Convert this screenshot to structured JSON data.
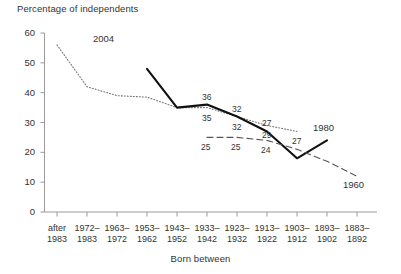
{
  "chart_data": {
    "type": "line",
    "title": "",
    "ylabel": "Percentage of independents",
    "xlabel": "Born between",
    "ylim": [
      0,
      60
    ],
    "yticks": [
      0,
      10,
      20,
      30,
      40,
      50,
      60
    ],
    "grid": false,
    "legend_position": "inline-annotation",
    "categories": [
      "after 1983",
      "1972-1983",
      "1963-1972",
      "1953-1962",
      "1943-1952",
      "1933-1942",
      "1923-1932",
      "1913-1922",
      "1903-1912",
      "1893-1902",
      "1883-1892"
    ],
    "category_lines": [
      [
        "after",
        "1983"
      ],
      [
        "1972–",
        "1983"
      ],
      [
        "1963–",
        "1972"
      ],
      [
        "1953–",
        "1962"
      ],
      [
        "1943–",
        "1952"
      ],
      [
        "1933–",
        "1942"
      ],
      [
        "1923–",
        "1932"
      ],
      [
        "1913–",
        "1922"
      ],
      [
        "1903–",
        "1912"
      ],
      [
        "1893–",
        "1902"
      ],
      [
        "1883–",
        "1892"
      ]
    ],
    "series": [
      {
        "name": "2004",
        "style": "dotted",
        "color": "#777777",
        "values": [
          56,
          42,
          39,
          38.5,
          35,
          35,
          32,
          29,
          27,
          null,
          null
        ],
        "point_labels": [
          null,
          null,
          null,
          null,
          null,
          "35",
          "32",
          "29",
          "27",
          null,
          null
        ]
      },
      {
        "name": "1980",
        "style": "solid",
        "color": "#111111",
        "values": [
          null,
          null,
          null,
          48,
          35,
          36,
          32,
          27,
          18,
          24,
          null
        ],
        "point_labels": [
          null,
          null,
          null,
          null,
          null,
          "36",
          "32",
          "27",
          null,
          null,
          null
        ]
      },
      {
        "name": "1960",
        "style": "dashed",
        "color": "#555555",
        "values": [
          null,
          null,
          null,
          null,
          null,
          25,
          25,
          24,
          21,
          17,
          12
        ],
        "point_labels": [
          null,
          null,
          null,
          null,
          null,
          "25",
          "25",
          "24",
          null,
          null,
          null
        ]
      }
    ],
    "series_annotations": [
      {
        "text": "2004",
        "x_category_index": 1,
        "y_value": 58
      },
      {
        "text": "1980",
        "x_category_index": 9,
        "y_value": 28
      },
      {
        "text": "1960",
        "x_category_index": 10,
        "y_value": 9
      }
    ]
  }
}
